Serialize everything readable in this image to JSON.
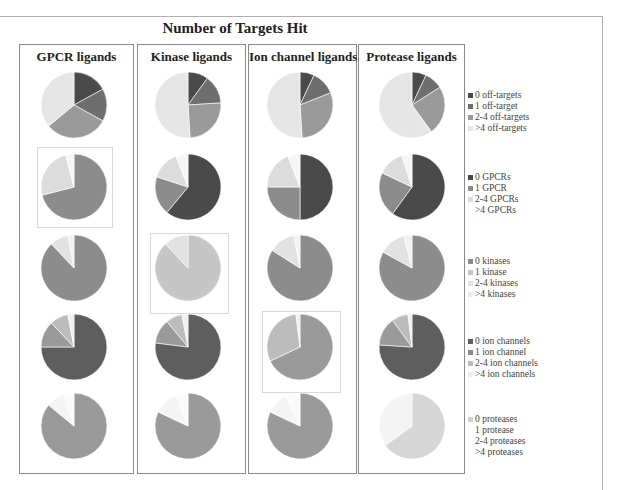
{
  "chart_data": {
    "type": "pie",
    "title": "Number of Targets Hit",
    "columns": [
      "GPCR ligands",
      "Kinase ligands",
      "Ion channel ligands",
      "Protease ligands"
    ],
    "rows": [
      {
        "name": "off-targets",
        "legend": [
          "0 off-targets",
          "1 off-target",
          "2-4 off-targets",
          ">4 off-targets"
        ],
        "colors": [
          "#4a4a4a",
          "#6e6e6e",
          "#9a9a9a",
          "#e6e6e6"
        ],
        "series": [
          {
            "column": "GPCR ligands",
            "values": [
              17,
              16,
              31,
              36
            ]
          },
          {
            "column": "Kinase ligands",
            "values": [
              10,
              14,
              25,
              51
            ]
          },
          {
            "column": "Ion channel ligands",
            "values": [
              7,
              12,
              30,
              51
            ]
          },
          {
            "column": "Protease ligands",
            "values": [
              7,
              9,
              24,
              60
            ]
          }
        ]
      },
      {
        "name": "GPCRs",
        "legend": [
          "0 GPCRs",
          "1 GPCR",
          "2-4 GPCRs",
          ">4 GPCRs"
        ],
        "colors": [
          "#4a4a4a",
          "#8c8c8c",
          "#dcdcdc",
          "#f6f6f6"
        ],
        "series": [
          {
            "column": "GPCR ligands",
            "values": [
              0,
              71,
              25,
              4
            ]
          },
          {
            "column": "Kinase ligands",
            "values": [
              61,
              19,
              14,
              6
            ]
          },
          {
            "column": "Ion channel ligands",
            "values": [
              50,
              25,
              19,
              6
            ]
          },
          {
            "column": "Protease ligands",
            "values": [
              60,
              22,
              13,
              5
            ]
          }
        ]
      },
      {
        "name": "kinases",
        "legend": [
          "0 kinases",
          "1 kinase",
          "2-4 kinases",
          ">4 kinases"
        ],
        "colors": [
          "#8c8c8c",
          "#c6c6c6",
          "#e2e2e2",
          "#f2f2f2"
        ],
        "series": [
          {
            "column": "GPCR ligands",
            "values": [
              88,
              0,
              9,
              3
            ]
          },
          {
            "column": "Kinase ligands",
            "values": [
              0,
              88,
              12,
              0
            ]
          },
          {
            "column": "Ion channel ligands",
            "values": [
              84,
              0,
              13,
              3
            ]
          },
          {
            "column": "Protease ligands",
            "values": [
              83,
              0,
              13,
              4
            ]
          }
        ]
      },
      {
        "name": "ion channels",
        "legend": [
          "0 ion channels",
          "1 ion channel",
          "2-4 ion channels",
          ">4 ion channels"
        ],
        "colors": [
          "#5e5e5e",
          "#9a9a9a",
          "#bcbcbc",
          "#f0f0f0"
        ],
        "series": [
          {
            "column": "GPCR ligands",
            "values": [
              75,
              13,
              9,
              3
            ]
          },
          {
            "column": "Kinase ligands",
            "values": [
              77,
              12,
              8,
              3
            ]
          },
          {
            "column": "Ion channel ligands",
            "values": [
              0,
              68,
              30,
              2
            ]
          },
          {
            "column": "Protease ligands",
            "values": [
              76,
              14,
              8,
              2
            ]
          }
        ]
      },
      {
        "name": "proteases",
        "legend": [
          "0 proteases",
          "1 protease",
          "2-4 proteases",
          ">4 proteases"
        ],
        "colors": [
          "#9a9a9a",
          "#d6d6d6",
          "#f4f4f4",
          "#fafafa"
        ],
        "series": [
          {
            "column": "GPCR ligands",
            "values": [
              86,
              0,
              9,
              5
            ]
          },
          {
            "column": "Kinase ligands",
            "values": [
              82,
              0,
              12,
              6
            ]
          },
          {
            "column": "Ion channel ligands",
            "values": [
              82,
              0,
              11,
              7
            ]
          },
          {
            "column": "Protease ligands",
            "values": [
              0,
              65,
              35,
              0
            ]
          }
        ]
      }
    ],
    "highlighted": [
      {
        "row": "GPCRs",
        "column": "GPCR ligands"
      },
      {
        "row": "kinases",
        "column": "Kinase ligands"
      },
      {
        "row": "ion channels",
        "column": "Ion channel ligands"
      }
    ],
    "legend_position": "right"
  },
  "header": {
    "title": "Number of Targets Hit"
  },
  "columns": [
    {
      "label": "GPCR ligands"
    },
    {
      "label": "Kinase ligands"
    },
    {
      "label": "Ion channel ligands"
    },
    {
      "label": "Protease ligands"
    }
  ],
  "legends": [
    {
      "items": [
        "0 off-targets",
        "1 off-target",
        "2-4 off-targets",
        ">4 off-targets"
      ]
    },
    {
      "items": [
        "0 GPCRs",
        "1 GPCR",
        "2-4 GPCRs",
        ">4 GPCRs"
      ]
    },
    {
      "items": [
        "0 kinases",
        "1 kinase",
        "2-4 kinases",
        ">4 kinases"
      ]
    },
    {
      "items": [
        "0 ion channels",
        "1 ion channel",
        "2-4 ion channels",
        ">4 ion channels"
      ]
    },
    {
      "items": [
        "0 proteases",
        "1 protease",
        "2-4 proteases",
        ">4 proteases"
      ]
    }
  ]
}
